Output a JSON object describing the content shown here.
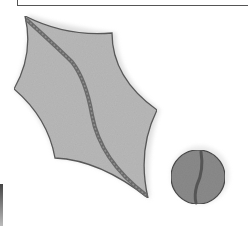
{
  "illustration": {
    "subject": "holly leaf and berry",
    "style": "grayscale pencil sketch",
    "colors": {
      "background": "#ffffff",
      "leaf_fill": "#b8b8b8",
      "leaf_outline": "#5a5a5a",
      "vein": "#6e6e6e",
      "berry_fill": "#8a8a8a",
      "berry_outline": "#4a4a4a",
      "frame": "#555555"
    },
    "elements": [
      {
        "name": "holly-leaf",
        "shape": "spiky leaf with central vein"
      },
      {
        "name": "berry",
        "shape": "circle with stripe"
      }
    ]
  }
}
